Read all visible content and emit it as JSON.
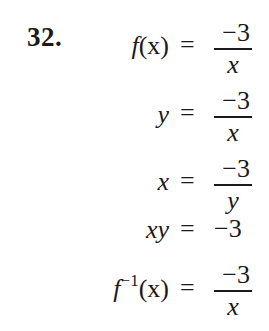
{
  "problem": {
    "number": "32."
  },
  "equations": [
    {
      "lhs_func": "f",
      "lhs_arg": "(x)",
      "eq": "=",
      "numerator": "−3",
      "denominator": "x"
    },
    {
      "lhs": "y",
      "eq": "=",
      "numerator": "−3",
      "denominator": "x"
    },
    {
      "lhs": "x",
      "eq": "=",
      "numerator": "−3",
      "denominator": "y"
    },
    {
      "lhs": "xy",
      "eq": "=",
      "rhs": "−3"
    },
    {
      "lhs_func": "f",
      "lhs_sup": "−1",
      "lhs_arg": "(x)",
      "eq": "=",
      "numerator": "−3",
      "denominator": "x"
    }
  ]
}
